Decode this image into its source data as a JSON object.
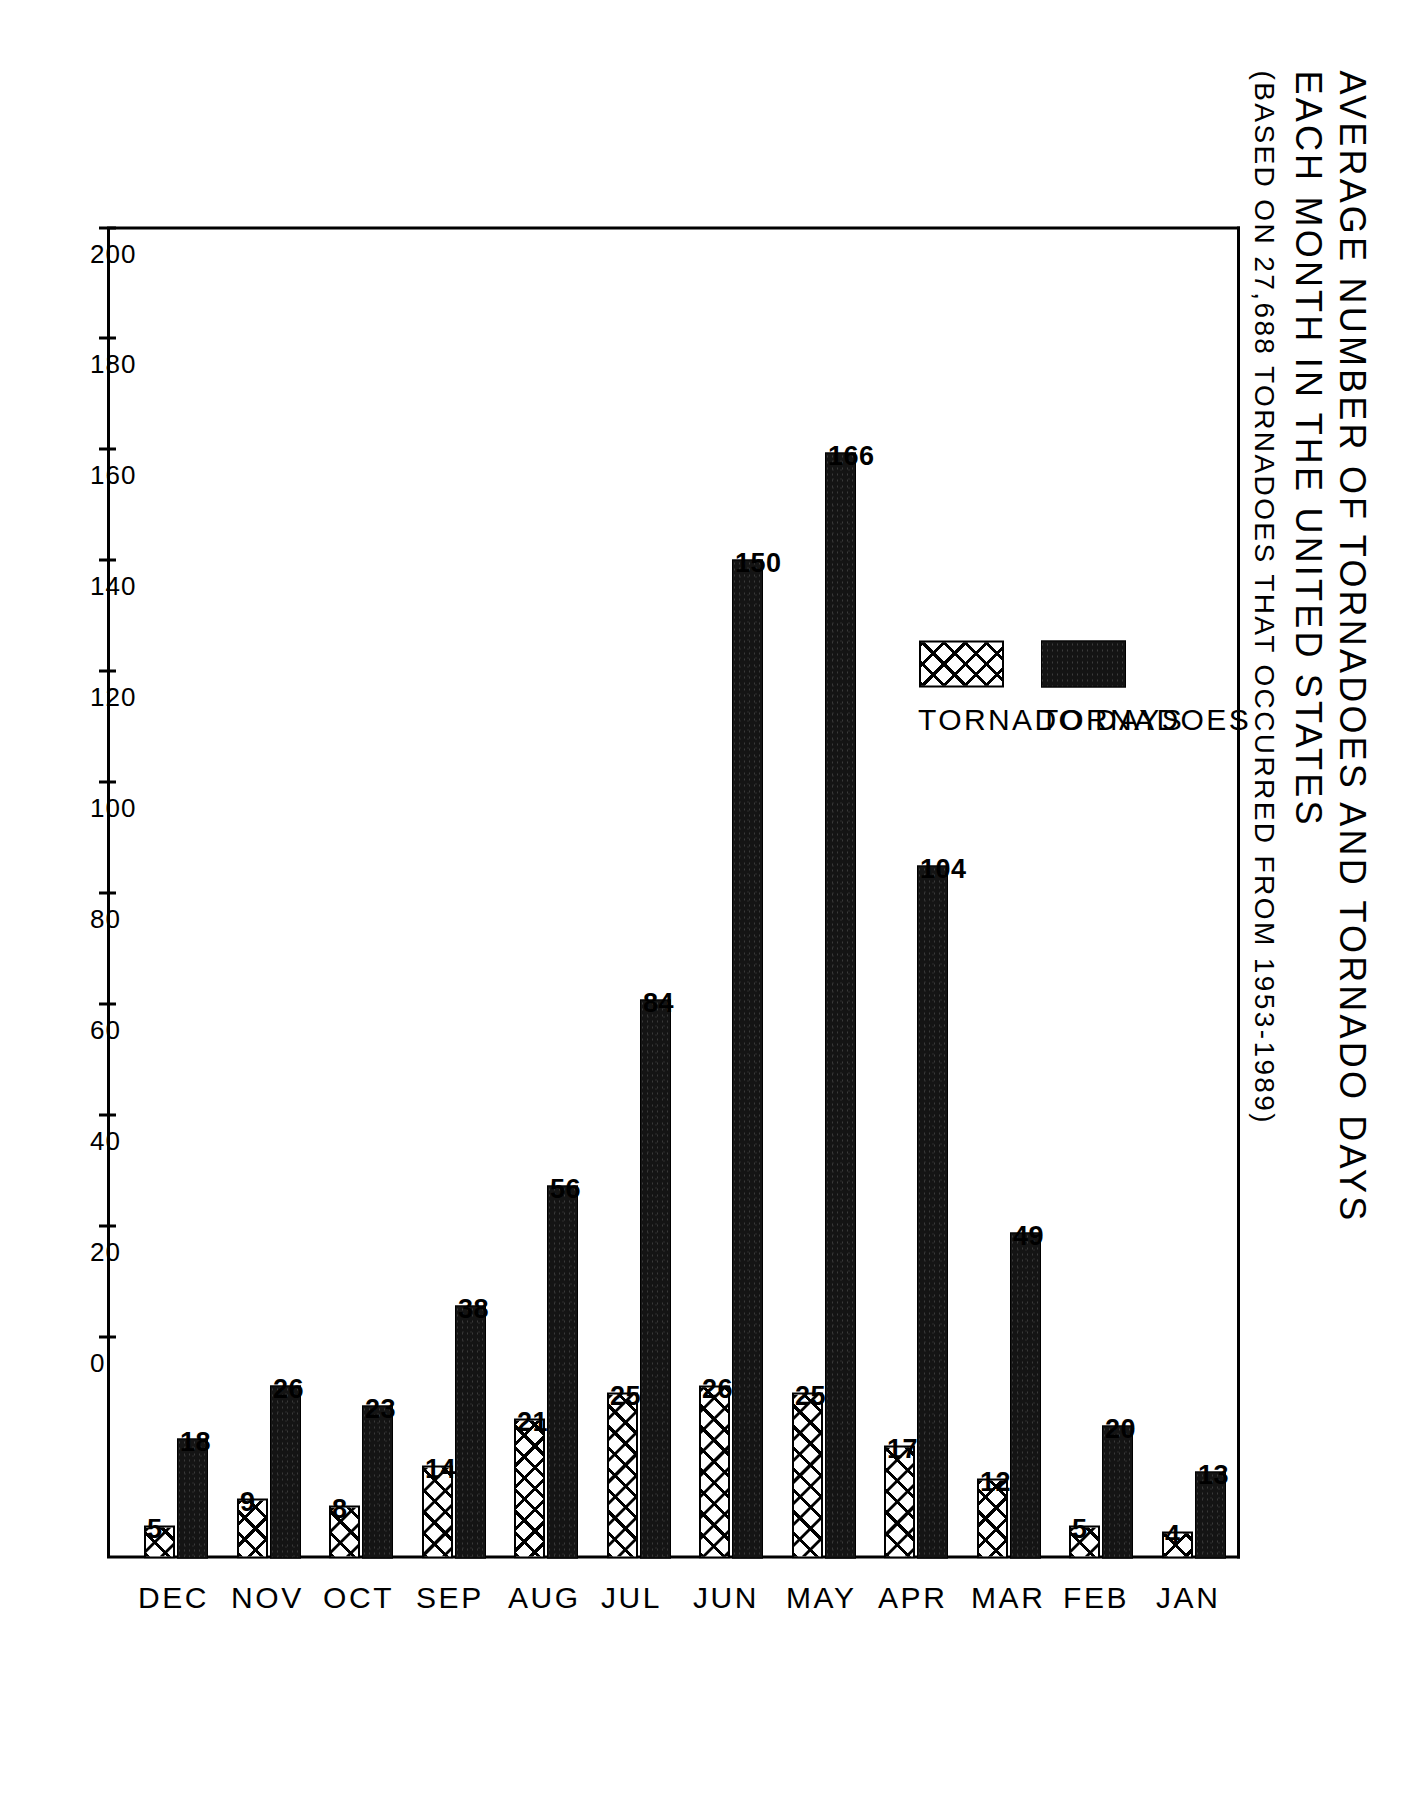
{
  "title": {
    "line1": "AVERAGE NUMBER OF TORNADOES AND TORNADO DAYS",
    "line2": "EACH MONTH IN THE UNITED STATES",
    "subtitle": "(BASED ON 27,688 TORNADOES THAT OCCURRED FROM 1953-1989)"
  },
  "legend": {
    "items": [
      {
        "label": "TORNADOES",
        "swatch": "solid-black"
      },
      {
        "label": "TORNADO DAYS",
        "swatch": "cross-hatch"
      }
    ]
  },
  "axis": {
    "tick_labels": [
      "200",
      "180",
      "160",
      "140",
      "120",
      "100",
      "80",
      "60",
      "40",
      "20",
      "0"
    ]
  },
  "chart_data": {
    "type": "bar",
    "title": "AVERAGE NUMBER OF TORNADOES AND TORNADO DAYS EACH MONTH IN THE UNITED STATES",
    "subtitle": "(BASED ON 27,688 TORNADOES THAT OCCURRED FROM 1953-1989)",
    "orientation": "horizontal",
    "categories": [
      "JAN",
      "FEB",
      "MAR",
      "APR",
      "MAY",
      "JUN",
      "JUL",
      "AUG",
      "SEP",
      "OCT",
      "NOV",
      "DEC"
    ],
    "series": [
      {
        "name": "TORNADOES",
        "values": [
          13,
          20,
          49,
          104,
          166,
          150,
          84,
          56,
          38,
          23,
          26,
          18
        ]
      },
      {
        "name": "TORNADO DAYS",
        "values": [
          4,
          5,
          12,
          17,
          25,
          26,
          25,
          21,
          14,
          8,
          9,
          5
        ]
      }
    ],
    "xlabel": "",
    "ylabel": "",
    "xlim": [
      0,
      200
    ],
    "ticks": [
      0,
      20,
      40,
      60,
      80,
      100,
      120,
      140,
      160,
      180,
      200
    ],
    "grid": false,
    "legend_position": "upper-left-inside",
    "data_labels": true
  }
}
